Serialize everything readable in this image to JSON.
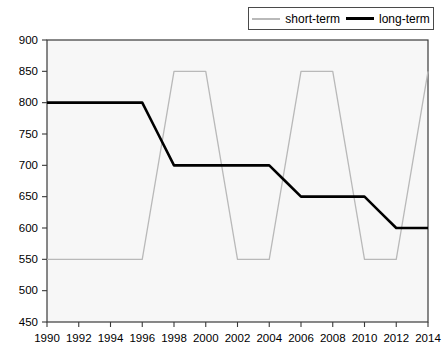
{
  "legend": {
    "position": "top-right",
    "entries": [
      {
        "label": "short-term",
        "color": "#b9b9b9",
        "icon": "line-swatch-icon"
      },
      {
        "label": "long-term",
        "color": "#000000",
        "icon": "line-swatch-icon"
      }
    ]
  },
  "chart_data": {
    "type": "line",
    "title": "",
    "xlabel": "",
    "ylabel": "",
    "xlim": [
      1990,
      2014
    ],
    "ylim": [
      450,
      900
    ],
    "grid": false,
    "legend_position": "top-right",
    "x": [
      1990,
      1991,
      1992,
      1993,
      1994,
      1995,
      1996,
      1997,
      1998,
      1999,
      2000,
      2001,
      2002,
      2003,
      2004,
      2005,
      2006,
      2007,
      2008,
      2009,
      2010,
      2011,
      2012,
      2013,
      2014
    ],
    "xticks": [
      1990,
      1992,
      1994,
      1996,
      1998,
      2000,
      2002,
      2004,
      2006,
      2008,
      2010,
      2012,
      2014
    ],
    "xticklabels": [
      "1990",
      "1992",
      "1994",
      "1996",
      "1998",
      "2000",
      "2002",
      "2004",
      "2006",
      "2008",
      "2010",
      "2012",
      "2014"
    ],
    "yticks": [
      450,
      500,
      550,
      600,
      650,
      700,
      750,
      800,
      850,
      900
    ],
    "yticklabels": [
      "450",
      "500",
      "550",
      "600",
      "650",
      "700",
      "750",
      "800",
      "850",
      "900"
    ],
    "series": [
      {
        "name": "short-term",
        "color": "#b9b9b9",
        "values": [
          550,
          550,
          550,
          550,
          550,
          550,
          550,
          700,
          850,
          850,
          850,
          700,
          550,
          550,
          550,
          700,
          850,
          850,
          850,
          700,
          550,
          550,
          550,
          700,
          850
        ]
      },
      {
        "name": "long-term",
        "color": "#000000",
        "values": [
          800,
          800,
          800,
          800,
          800,
          800,
          800,
          750,
          700,
          700,
          700,
          700,
          700,
          700,
          700,
          675,
          650,
          650,
          650,
          650,
          650,
          625,
          600,
          600,
          600
        ]
      }
    ]
  }
}
